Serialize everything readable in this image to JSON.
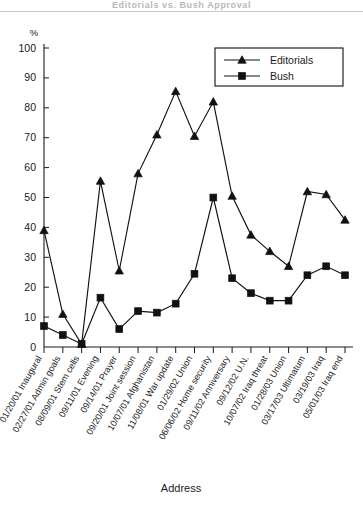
{
  "figure": {
    "title_fragment": "Editorials vs. Bush Approval",
    "y_axis_unit_label": "%",
    "x_axis_title": "Address"
  },
  "legend": {
    "position": "top-right",
    "entries": [
      {
        "label": "Editorials",
        "marker": "triangle",
        "color": "#111111"
      },
      {
        "label": "Bush",
        "marker": "square",
        "color": "#111111"
      }
    ]
  },
  "chart_data": {
    "type": "line",
    "title": "Editorials vs. Bush Approval",
    "xlabel": "Address",
    "ylabel": "%",
    "ylim": [
      0,
      100
    ],
    "ytick_step": 10,
    "yticks": [
      "0",
      "10",
      "20",
      "30",
      "40",
      "50",
      "60",
      "70",
      "80",
      "90",
      "100"
    ],
    "grid": false,
    "legend_position": "top-right",
    "categories": [
      "01/20/01 Inaugural",
      "02/27/01 Admin goals",
      "08/09/01 Stem cells",
      "09/11/01 Evening",
      "09/14/01 Prayer",
      "09/20/01 Joint session",
      "10/07/01 Afghanistan",
      "11/08/01 War update",
      "01/29/02 Union",
      "06/06/02 Home security",
      "09/11/02 Anniversary",
      "09/12/02 U.N.",
      "10/07/02 Iraq threat",
      "01/28/03 Union",
      "03/17/03 Ultimatum",
      "03/19/03 Iraq",
      "05/01/03 Iraq end"
    ],
    "series": [
      {
        "name": "Editorials",
        "marker": "triangle",
        "color": "#111111",
        "values": [
          39,
          11,
          1,
          55.5,
          25.5,
          58,
          71,
          85.5,
          70.5,
          82,
          50.5,
          37.5,
          32,
          27,
          52,
          51,
          42.5
        ]
      },
      {
        "name": "Bush",
        "marker": "square",
        "color": "#111111",
        "values": [
          7,
          4,
          1,
          16.5,
          6,
          12,
          11.5,
          14.5,
          24.5,
          50,
          23,
          18,
          15.5,
          15.5,
          24,
          27,
          24
        ]
      }
    ]
  }
}
